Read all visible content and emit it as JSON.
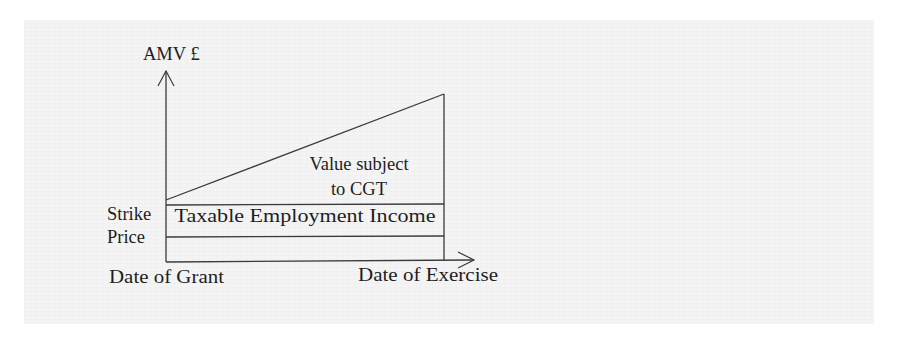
{
  "diagram": {
    "type": "share-option-tax-diagram",
    "y_axis": {
      "label": "AMV £"
    },
    "x_axis": {
      "start_label": "Date of Grant",
      "end_label": "Date of Exercise"
    },
    "left_label": {
      "line1": "Strike",
      "line2": "Price"
    },
    "regions": {
      "upper": {
        "line1": "Value subject",
        "line2": "to CGT"
      },
      "middle": {
        "label": "Taxable Employment Income"
      }
    },
    "colors": {
      "background": "#ffffff",
      "panel": "#f4f4f4",
      "lines": "#3a3a3a",
      "text": "#1e1e1e"
    }
  }
}
